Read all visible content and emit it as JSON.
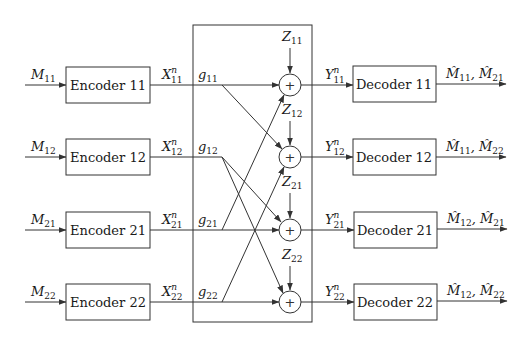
{
  "diagram": {
    "title": "",
    "rows": [
      {
        "input": {
          "sym": "M",
          "sub": "11"
        },
        "encoder": "Encoder 11",
        "tx": {
          "sym": "X",
          "sup": "n",
          "sub": "11"
        },
        "gain": {
          "sym": "g",
          "sub": "11"
        },
        "noise": {
          "sym": "Z",
          "sub": "11"
        },
        "rx": {
          "sym": "Y",
          "sup": "n",
          "sub": "11"
        },
        "decoder": "Decoder 11",
        "output": {
          "sym1": "M̂",
          "sub1": "11",
          "sym2": "M̂",
          "sub2": "21"
        }
      },
      {
        "input": {
          "sym": "M",
          "sub": "12"
        },
        "encoder": "Encoder 12",
        "tx": {
          "sym": "X",
          "sup": "n",
          "sub": "12"
        },
        "gain": {
          "sym": "g",
          "sub": "12"
        },
        "noise": {
          "sym": "Z",
          "sub": "12"
        },
        "rx": {
          "sym": "Y",
          "sup": "n",
          "sub": "12"
        },
        "decoder": "Decoder 12",
        "output": {
          "sym1": "M̂",
          "sub1": "11",
          "sym2": "M̂",
          "sub2": "22"
        }
      },
      {
        "input": {
          "sym": "M",
          "sub": "21"
        },
        "encoder": "Encoder 21",
        "tx": {
          "sym": "X",
          "sup": "n",
          "sub": "21"
        },
        "gain": {
          "sym": "g",
          "sub": "21"
        },
        "noise": {
          "sym": "Z",
          "sub": "21"
        },
        "rx": {
          "sym": "Y",
          "sup": "n",
          "sub": "21"
        },
        "decoder": "Decoder 21",
        "output": {
          "sym1": "M̂",
          "sub1": "12",
          "sym2": "M̂",
          "sub2": "21"
        }
      },
      {
        "input": {
          "sym": "M",
          "sub": "22"
        },
        "encoder": "Encoder 22",
        "tx": {
          "sym": "X",
          "sup": "n",
          "sub": "22"
        },
        "gain": {
          "sym": "g",
          "sub": "22"
        },
        "noise": {
          "sym": "Z",
          "sub": "22"
        },
        "rx": {
          "sym": "Y",
          "sup": "n",
          "sub": "22"
        },
        "decoder": "Decoder 22",
        "output": {
          "sym1": "M̂",
          "sub1": "12",
          "sym2": "M̂",
          "sub2": "22"
        }
      }
    ],
    "adder_symbol": "+",
    "cross_links": [
      {
        "from": "g11",
        "to": "adder-12"
      },
      {
        "from": "g12",
        "to": "adder-21"
      },
      {
        "from": "g12",
        "to": "adder-22"
      },
      {
        "from": "g21",
        "to": "adder-11"
      },
      {
        "from": "g22",
        "to": "adder-12"
      }
    ]
  }
}
